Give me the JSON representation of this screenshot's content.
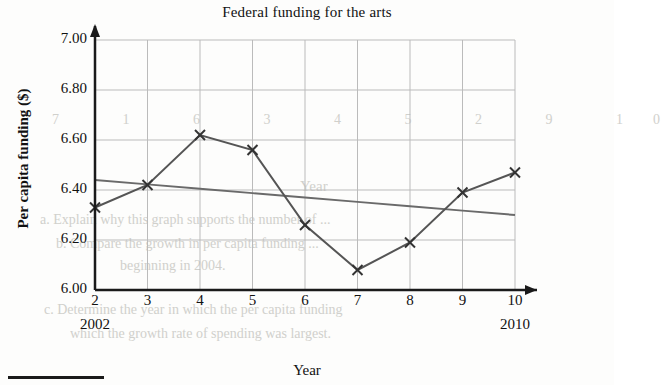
{
  "chart_data": {
    "type": "line",
    "title": "Federal funding for the arts",
    "xlabel": "Year",
    "ylabel": "Per capita funding ($)",
    "x": [
      2,
      3,
      4,
      5,
      6,
      7,
      8,
      9,
      10
    ],
    "xtick_labels": [
      "2",
      "3",
      "4",
      "5",
      "6",
      "7",
      "8",
      "9",
      "10"
    ],
    "x_end_labels": {
      "first": "2002",
      "last": "2010"
    },
    "xlim": [
      2,
      10
    ],
    "ylim": [
      6.0,
      7.0
    ],
    "ytick_labels": [
      "7.00",
      "6.80",
      "6.60",
      "6.40",
      "6.20",
      "6.00"
    ],
    "ytick_values": [
      7.0,
      6.8,
      6.6,
      6.4,
      6.2,
      6.0
    ],
    "grid": true,
    "legend": "none",
    "series": [
      {
        "name": "Per capita funding",
        "marker": "x",
        "color": "#555555",
        "values": [
          6.33,
          6.42,
          6.62,
          6.56,
          6.26,
          6.08,
          6.19,
          6.39,
          6.47
        ]
      },
      {
        "name": "Trend line",
        "marker": "none",
        "color": "#6a6a6a",
        "values": [
          6.44,
          6.4225,
          6.405,
          6.3875,
          6.37,
          6.3525,
          6.335,
          6.3175,
          6.3
        ]
      }
    ]
  },
  "axes": {
    "x_axis_arrow": true,
    "y_axis_arrow": true
  },
  "bleed_through": {
    "note": "faint reversed text showing through from the back of the page",
    "lines": [
      "7   1   6   3   4   5   2   9   10",
      "Year",
      "a. Explain why this graph supports the number of ...",
      "b. Compare the growth in per capita funding ...",
      "beginning in 2004.",
      "c. Determine the year in which the per capita funding",
      "which the growth rate of spending was largest."
    ]
  },
  "icons": {
    "marker": "x-marker",
    "arrow": "axis-arrow"
  },
  "colors": {
    "axis": "#1a1a1a",
    "grid": "#bbbbbb",
    "data_line": "#555555",
    "trend_line": "#6a6a6a",
    "background": "#fdfdfc"
  }
}
